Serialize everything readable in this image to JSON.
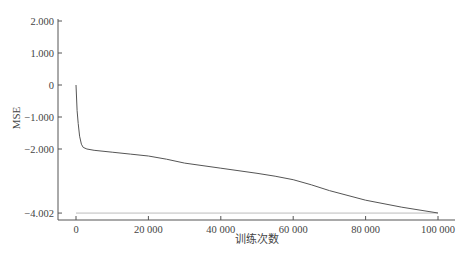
{
  "chart_data": {
    "type": "line",
    "title": "",
    "xlabel": "训练次数",
    "ylabel": "MSE",
    "xlim": [
      0,
      100000
    ],
    "ylim": [
      -4.002,
      2.0
    ],
    "grid": false,
    "legend": null,
    "x_ticks": [
      0,
      20000,
      40000,
      60000,
      80000,
      100000
    ],
    "x_tick_labels": [
      "0",
      "20 000",
      "40 000",
      "60 000",
      "80 000",
      "100 000"
    ],
    "y_ticks": [
      2.0,
      1.0,
      0,
      -1.0,
      -2.0,
      -4.002
    ],
    "y_tick_labels": [
      "2.000",
      "1.000",
      "0",
      "-1.000",
      "-2.000",
      "-4.002"
    ],
    "reference_line": {
      "y": -4.002,
      "style": "light horizontal line"
    },
    "series": [
      {
        "name": "MSE",
        "color": "#555555",
        "x": [
          0,
          300,
          600,
          1000,
          1500,
          2000,
          3000,
          5000,
          10000,
          15000,
          20000,
          25000,
          30000,
          40000,
          50000,
          55000,
          60000,
          65000,
          70000,
          80000,
          90000,
          100000
        ],
        "y": [
          0.0,
          -0.8,
          -1.2,
          -1.6,
          -1.85,
          -1.95,
          -2.0,
          -2.04,
          -2.1,
          -2.16,
          -2.22,
          -2.32,
          -2.44,
          -2.6,
          -2.76,
          -2.85,
          -2.96,
          -3.12,
          -3.3,
          -3.6,
          -3.82,
          -4.0
        ]
      }
    ]
  }
}
